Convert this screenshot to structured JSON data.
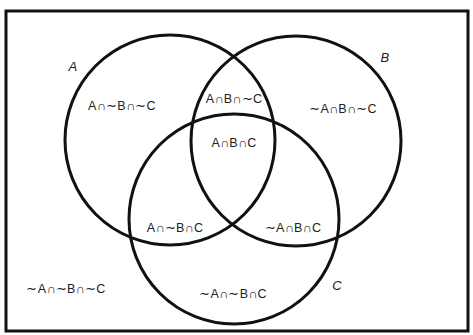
{
  "diagram": {
    "type": "venn",
    "sets": [
      {
        "name": "A",
        "cx": 170,
        "cy": 140,
        "r": 105,
        "label_x": 73,
        "label_y": 66
      },
      {
        "name": "B",
        "cx": 296,
        "cy": 141,
        "r": 105,
        "label_x": 385,
        "label_y": 57
      },
      {
        "name": "C",
        "cx": 234,
        "cy": 219,
        "r": 105,
        "label_x": 337,
        "label_y": 285
      }
    ],
    "regions": [
      {
        "id": "a_only",
        "text": "A∩∼B∩∼C",
        "x": 122,
        "y": 105
      },
      {
        "id": "ab_only",
        "text": "A∩B∩∼C",
        "x": 234,
        "y": 98
      },
      {
        "id": "b_only",
        "text": "∼A∩B∩∼C",
        "x": 343,
        "y": 108
      },
      {
        "id": "abc",
        "text": "A∩B∩C",
        "x": 234,
        "y": 143
      },
      {
        "id": "ac_only",
        "text": "A∩∼B∩C",
        "x": 175,
        "y": 227
      },
      {
        "id": "bc_only",
        "text": "∼A∩B∩C",
        "x": 293,
        "y": 227
      },
      {
        "id": "c_only",
        "text": "∼A∩∼B∩C",
        "x": 233,
        "y": 293
      },
      {
        "id": "none",
        "text": "∼A∩∼B∩∼C",
        "x": 66,
        "y": 288
      }
    ],
    "frame": {
      "x": 6,
      "y": 11,
      "width": 462,
      "height": 320
    },
    "stroke_color": "#111111"
  }
}
